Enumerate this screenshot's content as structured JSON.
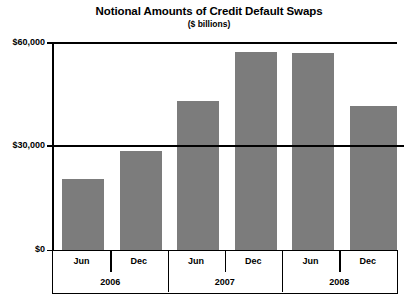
{
  "chart": {
    "title": "Notional Amounts of Credit Default Swaps",
    "subtitle": "($ billions)"
  },
  "chart_data": {
    "type": "bar",
    "title": "Notional Amounts of Credit Default Swaps",
    "subtitle": "($ billions)",
    "xlabel": "",
    "ylabel": "",
    "ylim": [
      0,
      60000
    ],
    "yticks": [
      0,
      30000,
      60000
    ],
    "ytick_labels": [
      "$0",
      "$30,000",
      "$60,000"
    ],
    "grid": true,
    "legend": null,
    "categories": [
      "Jun",
      "Dec",
      "Jun",
      "Dec",
      "Jun",
      "Dec"
    ],
    "groups": [
      {
        "label": "2006",
        "periods": [
          "Jun",
          "Dec"
        ]
      },
      {
        "label": "2007",
        "periods": [
          "Jun",
          "Dec"
        ]
      },
      {
        "label": "2008",
        "periods": [
          "Jun",
          "Dec"
        ]
      }
    ],
    "values": [
      20600,
      28600,
      42900,
      57200,
      56900,
      41400
    ],
    "points": [
      {
        "group": "2006",
        "period": "Jun",
        "value": 20600
      },
      {
        "group": "2006",
        "period": "Dec",
        "value": 28600
      },
      {
        "group": "2007",
        "period": "Jun",
        "value": 42900
      },
      {
        "group": "2007",
        "period": "Dec",
        "value": 57200
      },
      {
        "group": "2008",
        "period": "Jun",
        "value": 56900
      },
      {
        "group": "2008",
        "period": "Dec",
        "value": 41400
      }
    ],
    "bar_color": "#7c7c7c",
    "axis_color": "#000000",
    "background": "#ffffff"
  }
}
